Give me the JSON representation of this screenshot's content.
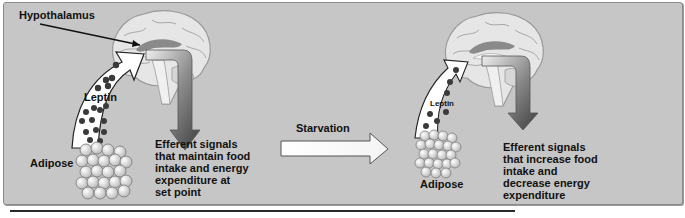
{
  "figure": {
    "left_panel": {
      "label_hypothalamus": "Hypothalamus",
      "label_leptin": "Leptin",
      "label_adipose": "Adipose",
      "efferent_text": "Efferent signals\nthat maintain food\nintake and energy\nexpenditure at\nset point"
    },
    "transition": {
      "label": "Starvation"
    },
    "right_panel": {
      "label_leptin": "Leptin",
      "label_adipose": "Adipose",
      "efferent_text": "Efferent signals\nthat increase food\nintake and\ndecrease energy\nexpenditure"
    },
    "colors": {
      "panel_bg": "#c6c6c6",
      "leptin_dot": "#3a3a3a",
      "arrow_dark": "#4a4a4a",
      "arrow_light": "#e8e8e8"
    }
  }
}
